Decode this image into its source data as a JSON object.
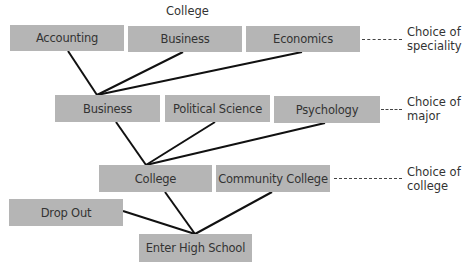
{
  "header": {
    "title": "College"
  },
  "levels": {
    "speciality": {
      "label": "Choice of speciality",
      "label_line1": "Choice of",
      "label_line2": "speciality",
      "options": [
        "Accounting",
        "Business",
        "Economics"
      ]
    },
    "major": {
      "label": "Choice of major",
      "label_line1": "Choice of",
      "label_line2": "major",
      "options": [
        "Business",
        "Political Science",
        "Psychology"
      ]
    },
    "college": {
      "label": "Choice of college",
      "label_line1": "Choice of",
      "label_line2": "college",
      "options": [
        "College",
        "Community College"
      ]
    },
    "high_school": {
      "options": [
        "Drop Out"
      ],
      "root": "Enter High School"
    }
  },
  "edges": [
    [
      "Enter High School",
      "Drop Out"
    ],
    [
      "Enter High School",
      "College"
    ],
    [
      "Enter High School",
      "Community College"
    ],
    [
      "College",
      "Business (major)"
    ],
    [
      "College",
      "Political Science"
    ],
    [
      "College",
      "Psychology"
    ],
    [
      "Business (major)",
      "Accounting"
    ],
    [
      "Business (major)",
      "Business (speciality)"
    ],
    [
      "Business (major)",
      "Economics"
    ]
  ],
  "colors": {
    "box_fill": "#b5b5b5",
    "line": "#111111",
    "text": "#333333"
  }
}
